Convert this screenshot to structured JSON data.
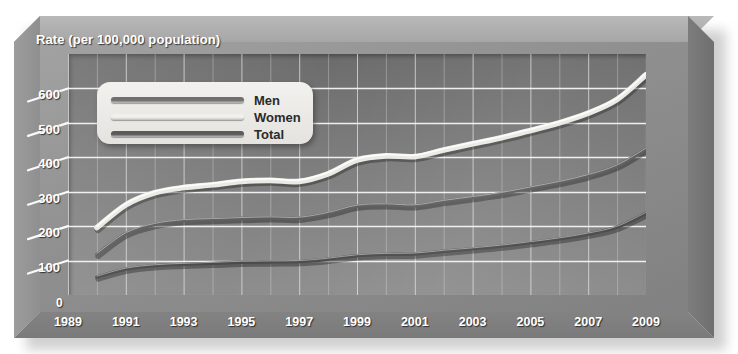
{
  "chart_data": {
    "type": "line",
    "title": "Rate (per 100,000 population)",
    "xlabel": "",
    "ylabel": "Rate (per 100,000 population)",
    "ylim": [
      0,
      700
    ],
    "xlim": [
      1989,
      2009
    ],
    "grid": true,
    "legend_position": "upper-left-inside",
    "y_ticks": [
      "0",
      "100",
      "200",
      "300",
      "400",
      "500",
      "600"
    ],
    "y_tick_values": [
      0,
      100,
      200,
      300,
      400,
      500,
      600
    ],
    "x_ticks": [
      "1989",
      "1991",
      "1993",
      "1995",
      "1997",
      "1999",
      "2001",
      "2003",
      "2005",
      "2007",
      "2009"
    ],
    "x_tick_values": [
      1989,
      1991,
      1993,
      1995,
      1997,
      1999,
      2001,
      2003,
      2005,
      2007,
      2009
    ],
    "x": [
      1990,
      1991,
      1992,
      1993,
      1994,
      1995,
      1996,
      1997,
      1998,
      1999,
      2000,
      2001,
      2002,
      2003,
      2004,
      2005,
      2006,
      2007,
      2008,
      2009
    ],
    "series": [
      {
        "name": "Men",
        "color": "#ebe9e4",
        "values": [
          196,
          262,
          297,
          312,
          320,
          330,
          333,
          330,
          352,
          392,
          404,
          402,
          421,
          439,
          457,
          478,
          500,
          528,
          568,
          640
        ]
      },
      {
        "name": "Women",
        "color": "#5e5e5e",
        "values": [
          118,
          178,
          205,
          216,
          219,
          222,
          224,
          223,
          237,
          258,
          262,
          259,
          272,
          283,
          295,
          311,
          327,
          347,
          375,
          424
        ]
      },
      {
        "name": "Total",
        "color": "#4a4a4a",
        "values": [
          52,
          75,
          85,
          89,
          92,
          95,
          96,
          97,
          104,
          114,
          118,
          119,
          127,
          134,
          142,
          152,
          163,
          177,
          197,
          237
        ]
      }
    ]
  },
  "legend": {
    "items": [
      {
        "label": "Men",
        "color": "#6f6f6f"
      },
      {
        "label": "Women",
        "color": "#f1f0ec"
      },
      {
        "label": "Total",
        "color": "#5a5a5a"
      }
    ]
  },
  "colors": {
    "plot_background_top": "#6c6c6c",
    "plot_background_bottom": "#8d8d8d",
    "frame_face": "#8f8f8f",
    "gridline": "#f5f5f5",
    "tick_text": "#ffffff"
  }
}
